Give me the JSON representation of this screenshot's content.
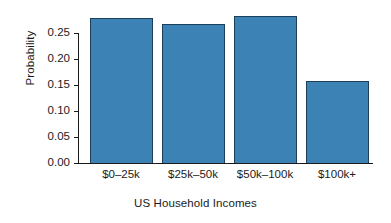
{
  "chart_data": {
    "type": "bar",
    "title": "",
    "subtitle": "",
    "xlabel": "US Household Incomes",
    "ylabel": "Probability",
    "categories": [
      "$0–25k",
      "$25k–50k",
      "$50k–100k",
      "$100k+"
    ],
    "values": [
      0.28,
      0.27,
      0.285,
      0.16
    ],
    "series": [
      {
        "name": "Probability",
        "values": [
          0.28,
          0.27,
          0.285,
          0.16
        ]
      }
    ],
    "ylim": [
      0.0,
      0.29
    ],
    "yticks": [
      0.0,
      0.05,
      0.1,
      0.15,
      0.2,
      0.25
    ],
    "ytick_labels": [
      "0.00",
      "0.05",
      "0.10",
      "0.15",
      "0.20",
      "0.25"
    ],
    "grid": false,
    "legend": false,
    "legend_position": "none",
    "bar_fill_color": "#3d82b4",
    "bar_border_color": "#1c3f5c",
    "axis_color": "#1a1a1a",
    "background_color": "#ffffff"
  }
}
